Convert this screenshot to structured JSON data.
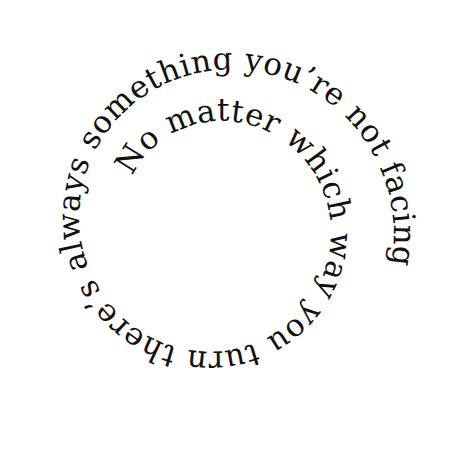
{
  "image": {
    "description": "Spiral typographic quote",
    "text": "No matter which way you turn there’s always something you’re not facing",
    "text_color": "#111111",
    "background": "#ffffff"
  }
}
